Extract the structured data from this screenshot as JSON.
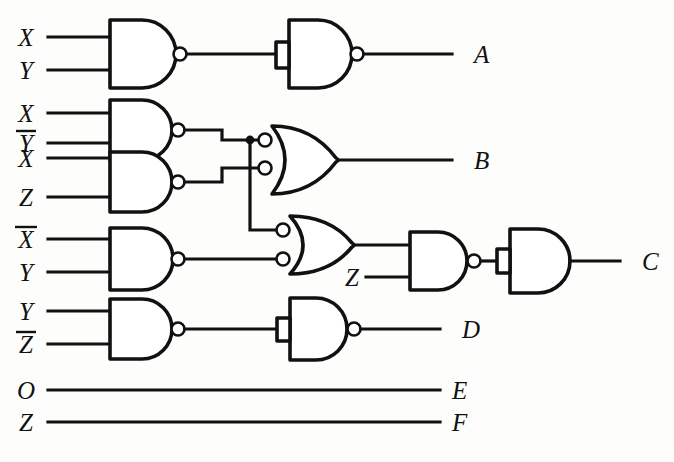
{
  "diagram": {
    "type": "combinational-logic-network",
    "line_color": "#111111",
    "background_color": "#fdfdfc"
  },
  "inputs": [
    {
      "id": "in-1",
      "label": "X",
      "overbar": false,
      "y": 37,
      "feeds": "nand-1"
    },
    {
      "id": "in-2",
      "label": "Y",
      "overbar": false,
      "y": 70,
      "feeds": "nand-1"
    },
    {
      "id": "in-3",
      "label": "X",
      "overbar": false,
      "y": 113,
      "feeds": "nand-2"
    },
    {
      "id": "in-4",
      "label": "Y",
      "overbar": true,
      "y": 143,
      "feeds": "nand-2"
    },
    {
      "id": "in-5",
      "label": "X",
      "overbar": false,
      "y": 158,
      "feeds": "nand-3"
    },
    {
      "id": "in-6",
      "label": "Z",
      "overbar": false,
      "y": 197,
      "feeds": "nand-3"
    },
    {
      "id": "in-7",
      "label": "X",
      "overbar": true,
      "y": 239,
      "feeds": "nand-4"
    },
    {
      "id": "in-8",
      "label": "Y",
      "overbar": false,
      "y": 272,
      "feeds": "nand-4"
    },
    {
      "id": "in-9",
      "label": "Y",
      "overbar": false,
      "y": 311,
      "feeds": "nand-5"
    },
    {
      "id": "in-10",
      "label": "Z",
      "overbar": true,
      "y": 344,
      "feeds": "nand-5"
    },
    {
      "id": "in-11",
      "label": "O",
      "overbar": false,
      "y": 390,
      "feeds": "output-E"
    },
    {
      "id": "in-12",
      "label": "Z",
      "overbar": false,
      "y": 422,
      "feeds": "output-F"
    }
  ],
  "extra_inputs": [
    {
      "id": "in-z-c",
      "label": "Z",
      "overbar": false,
      "y": 277,
      "feeds": "nand-7"
    }
  ],
  "outputs": [
    {
      "id": "out-A",
      "label": "A",
      "y": 60,
      "x": 474,
      "source": "nand-6"
    },
    {
      "id": "out-B",
      "label": "B",
      "y": 160,
      "x": 474,
      "source": "or-1"
    },
    {
      "id": "out-C",
      "label": "C",
      "y": 265,
      "x": 642,
      "source": "and-1"
    },
    {
      "id": "out-D",
      "label": "D",
      "y": 323,
      "x": 474,
      "source": "nand-8"
    },
    {
      "id": "out-E",
      "label": "E",
      "y": 390,
      "x": 462,
      "source": "in-11"
    },
    {
      "id": "out-F",
      "label": "F",
      "y": 422,
      "x": 462,
      "source": "in-12"
    }
  ],
  "gates": [
    {
      "id": "nand-1",
      "type": "NAND",
      "inputs": 2,
      "tied": false,
      "label": "nand-gate-x-y",
      "out_label": "to inverter for A"
    },
    {
      "id": "nand-2",
      "type": "NAND",
      "inputs": 2,
      "tied": false,
      "label": "nand-gate-x-ybar",
      "out_label": "to or-1 and or-2"
    },
    {
      "id": "nand-3",
      "type": "NAND",
      "inputs": 2,
      "tied": false,
      "label": "nand-gate-x-z",
      "out_label": "to or-1"
    },
    {
      "id": "nand-4",
      "type": "NAND",
      "inputs": 2,
      "tied": false,
      "label": "nand-gate-xbar-y",
      "out_label": "to or-2"
    },
    {
      "id": "nand-5",
      "type": "NAND",
      "inputs": 2,
      "tied": false,
      "label": "nand-gate-y-zbar",
      "out_label": "to inverter for D"
    },
    {
      "id": "nand-6",
      "type": "NAND",
      "inputs": 1,
      "tied": true,
      "label": "nand-inverter-a",
      "out_label": "A"
    },
    {
      "id": "nand-7",
      "type": "NAND",
      "inputs": 2,
      "tied": false,
      "label": "nand-gate-or2-z",
      "out_label": "to and-1"
    },
    {
      "id": "nand-8",
      "type": "NAND",
      "inputs": 1,
      "tied": true,
      "label": "nand-inverter-d",
      "out_label": "D"
    },
    {
      "id": "or-1",
      "type": "OR",
      "inputs": 2,
      "inverted_inputs": true,
      "label": "or-gate-b",
      "out_label": "B"
    },
    {
      "id": "or-2",
      "type": "OR",
      "inputs": 2,
      "inverted_inputs": true,
      "label": "or-gate-c",
      "out_label": "to nand-7"
    },
    {
      "id": "and-1",
      "type": "AND",
      "inputs": 1,
      "tied": true,
      "label": "and-buffer-c",
      "out_label": "C"
    }
  ],
  "notes": {
    "bubble_meaning": "small open circle = logical inversion",
    "junction_meaning": "filled dot = wire junction / tie point"
  }
}
